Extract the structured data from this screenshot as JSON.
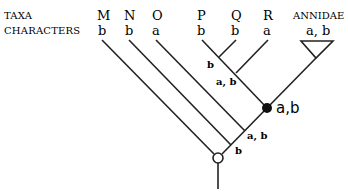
{
  "diagram": {
    "type": "cladogram",
    "row_labels": {
      "taxa": "TAXA",
      "characters": "CHARACTERS"
    },
    "taxa": [
      {
        "name": "M",
        "character": "b"
      },
      {
        "name": "N",
        "character": "b"
      },
      {
        "name": "O",
        "character": "a"
      },
      {
        "name": "P",
        "character": "b"
      },
      {
        "name": "Q",
        "character": "b"
      },
      {
        "name": "R",
        "character": "a"
      },
      {
        "name": "ANNIDAE",
        "character": "a, b"
      }
    ],
    "node_labels": {
      "pq_branch": "b",
      "r_branch": "a, b",
      "filled_node": "a,b",
      "o_branch": "a, b",
      "n_branch": "b"
    },
    "colors": {
      "line": "#222222",
      "background": "#ffffff"
    }
  }
}
